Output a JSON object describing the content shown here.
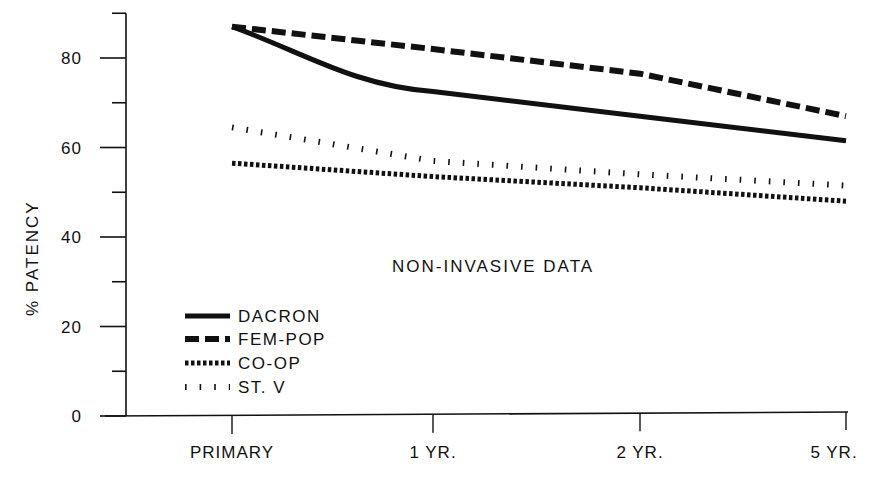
{
  "chart_data": {
    "type": "line",
    "title": "",
    "annotation": "NON-INVASIVE DATA",
    "xlabel": "",
    "ylabel": "% PATENCY",
    "categories": [
      "PRIMARY",
      "1 YR.",
      "2 YR.",
      "5 YR."
    ],
    "ylim": [
      0,
      90
    ],
    "yticks_labeled": [
      0,
      20,
      40,
      60,
      80
    ],
    "yticks_minor": [
      10,
      30,
      50,
      70,
      90
    ],
    "grid": false,
    "legend_position": "lower-left",
    "series": [
      {
        "name": "DACRON",
        "style": "solid",
        "values": [
          87,
          72.5,
          67,
          61.5
        ]
      },
      {
        "name": "FEM-POP",
        "style": "dashed",
        "values": [
          87,
          82,
          76.5,
          67
        ]
      },
      {
        "name": "CO-OP",
        "style": "dotted",
        "values": [
          56.5,
          53.5,
          51,
          48
        ]
      },
      {
        "name": "ST. V",
        "style": "hatched",
        "values": [
          64.5,
          57,
          54,
          51.5
        ]
      }
    ]
  },
  "colors": {
    "ink": "#111111",
    "background": "#ffffff"
  }
}
